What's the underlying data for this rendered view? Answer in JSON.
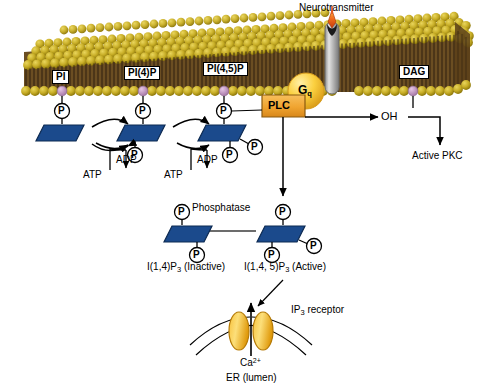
{
  "diagram": {
    "membrane": {
      "headgroup_color": "#c8ae27",
      "headgroup_dark": "#9a8410",
      "tail_color": "#4a3417",
      "interior_color": "#6b4e22"
    },
    "colors": {
      "inositol_blue": "#1b4a8c",
      "inositol_blue_dark": "#0f2f5e",
      "plc_orange": "#f0a430",
      "plc_border": "#8a5a10",
      "gq_yellow": "#fbd64a",
      "gq_edge": "#d79b1c",
      "receptor_grey": "#b7b7b7",
      "neurotransmitter": "#e8561c",
      "anchor_pink": "#c9a0c9",
      "er_gold": "#f5b11e",
      "line_black": "#000000"
    },
    "labels": {
      "neurotransmitter": "Neurotransmitter",
      "pi": "PI",
      "pi4p": "PI(4)P",
      "pi45p": "PI(4,5)P",
      "dag": "DAG",
      "plc": "PLC",
      "gq_main": "G",
      "gq_sub": "q",
      "oh": "OH",
      "active_pkc": "Active PKC",
      "atp_1": "ATP",
      "adp_1": "ADP",
      "atp_2": "ATP",
      "adp_2": "ADP",
      "phosphatase": "Phosphatase",
      "ip3_inactive_main": "I(1,4)P",
      "ip3_inactive_sub": "3",
      "ip3_inactive_state": " (Inactive)",
      "ip3_active_main": "I(1,4, 5)P",
      "ip3_active_sub": "3",
      "ip3_active_state": " (Active)",
      "ip3_receptor_main": "IP",
      "ip3_receptor_sub": "3",
      "ip3_receptor_rest": " receptor",
      "calcium_main": "Ca",
      "calcium_sup": "2+",
      "er_lumen": "ER (lumen)",
      "phosphate_glyph": "P"
    },
    "phosphate_groups": {
      "pi_count": 1,
      "pi4p_count": 2,
      "pi45p_count": 3,
      "ip3_inactive_count": 2,
      "ip3_active_count": 3
    }
  }
}
